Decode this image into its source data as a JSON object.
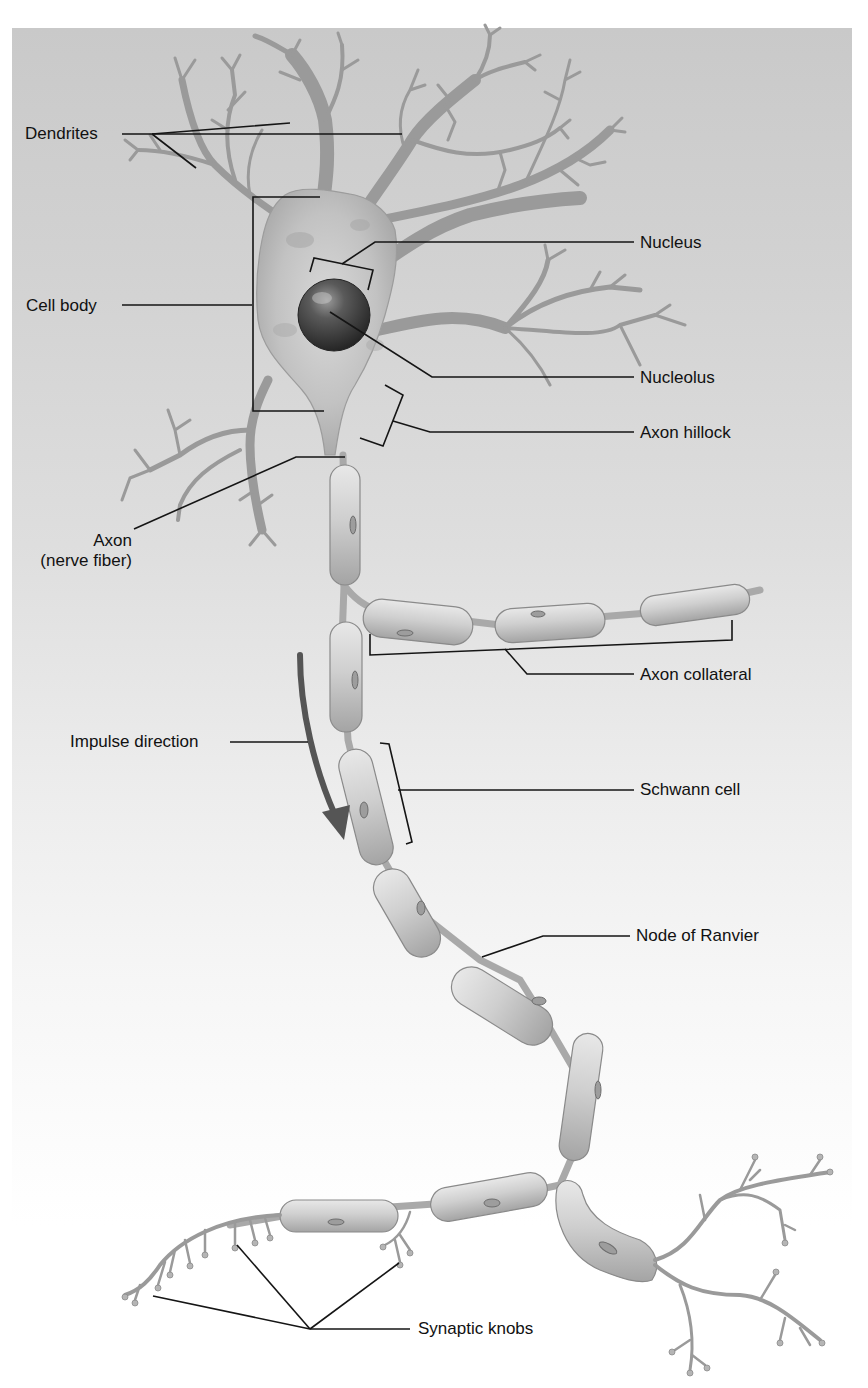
{
  "figure": {
    "colors": {
      "panel_top": "#c9c9c9",
      "panel_bottom": "#ffffff",
      "label_text": "#111111",
      "leader_line": "#151515",
      "neuron_fill": "#bdbdbd",
      "nucleus_dark": "#3a3a3a",
      "impulse_arrow": "#555555"
    }
  },
  "labels": {
    "dendrites": "Dendrites",
    "cell_body": "Cell body",
    "nucleus": "Nucleus",
    "nucleolus": "Nucleolus",
    "axon_hillock": "Axon hillock",
    "axon_line1": "Axon",
    "axon_line2": "(nerve fiber)",
    "axon_collateral": "Axon collateral",
    "impulse_direction": "Impulse direction",
    "schwann_cell": "Schwann cell",
    "node_of_ranvier": "Node of Ranvier",
    "synaptic_knobs": "Synaptic knobs"
  },
  "label_positions": {
    "dendrites": {
      "x": 25,
      "y": 123
    },
    "cell_body": {
      "x": 26,
      "y": 297
    },
    "nucleus": {
      "x": 640,
      "y": 234
    },
    "nucleolus": {
      "x": 640,
      "y": 369
    },
    "axon_hillock": {
      "x": 640,
      "y": 424
    },
    "axon": {
      "right": 738,
      "y": 533
    },
    "axon_collateral": {
      "x": 640,
      "y": 666
    },
    "impulse_direction": {
      "x": 70,
      "y": 733
    },
    "schwann_cell": {
      "x": 640,
      "y": 780
    },
    "node_of_ranvier": {
      "x": 636,
      "y": 875
    },
    "synaptic_knobs": {
      "x": 418,
      "y": 1327
    }
  },
  "leaders": {
    "dendrites": [
      [
        122,
        134
      ],
      [
        152,
        134
      ],
      [
        290,
        123
      ]
    ],
    "dendrites_b": [
      [
        152,
        134
      ],
      [
        402,
        134
      ]
    ],
    "dendrites_c": [
      [
        152,
        134
      ],
      [
        196,
        168
      ]
    ],
    "cell_body": [
      [
        122,
        305
      ],
      [
        252,
        305
      ]
    ],
    "cell_body_bracket": [
      [
        320,
        197
      ],
      [
        253,
        197
      ],
      [
        253,
        411
      ],
      [
        324,
        411
      ]
    ],
    "nucleus_bracket": [
      [
        310,
        272
      ],
      [
        314,
        258
      ],
      [
        373,
        270
      ],
      [
        368,
        290
      ]
    ],
    "nucleus": [
      [
        342,
        264
      ],
      [
        375,
        242
      ],
      [
        634,
        242
      ]
    ],
    "nucleolus": [
      [
        330,
        312
      ],
      [
        432,
        377
      ],
      [
        634,
        377
      ]
    ],
    "axon_hillock_bracket": [
      [
        385,
        385
      ],
      [
        403,
        395
      ],
      [
        383,
        446
      ],
      [
        360,
        438
      ]
    ],
    "axon_hillock": [
      [
        393,
        421
      ],
      [
        430,
        432
      ],
      [
        634,
        432
      ]
    ],
    "axon": [
      [
        134,
        529
      ],
      [
        296,
        457
      ],
      [
        345,
        457
      ]
    ],
    "collateral_bracket": [
      [
        370,
        634
      ],
      [
        370,
        655
      ],
      [
        732,
        640
      ],
      [
        732,
        620
      ]
    ],
    "axon_collateral": [
      [
        505,
        649
      ],
      [
        527,
        674
      ],
      [
        634,
        674
      ]
    ],
    "impulse_direction": [
      [
        230,
        742
      ],
      [
        308,
        742
      ]
    ],
    "schwann_bracket": [
      [
        380,
        743
      ],
      [
        389,
        744
      ],
      [
        412,
        842
      ],
      [
        406,
        844
      ]
    ],
    "schwann_cell": [
      [
        398,
        790
      ],
      [
        634,
        790
      ]
    ],
    "node_of_ranvier": [
      [
        482,
        957
      ],
      [
        543,
        936
      ],
      [
        630,
        936
      ]
    ],
    "synaptic_a": [
      [
        153,
        1296
      ],
      [
        310,
        1329
      ]
    ],
    "synaptic_b": [
      [
        237,
        1245
      ],
      [
        310,
        1329
      ]
    ],
    "synaptic_c": [
      [
        399,
        1263
      ],
      [
        310,
        1329
      ]
    ],
    "synaptic_d": [
      [
        310,
        1329
      ],
      [
        410,
        1329
      ]
    ]
  }
}
